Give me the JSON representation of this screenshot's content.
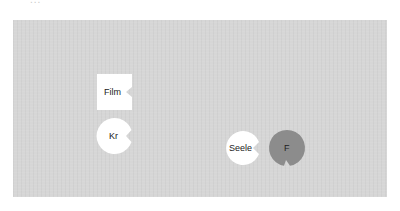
{
  "header": {
    "cut_off_label": "..."
  },
  "colors": {
    "background": "#ffffff",
    "panel": "#d6d6d6",
    "node_white": "#ffffff",
    "node_gray": "#8c8c8c",
    "text": "#222222"
  },
  "nodes": [
    {
      "id": "film",
      "label": "Film",
      "shape": "square-notched"
    },
    {
      "id": "kr",
      "label": "Kr",
      "shape": "circle-notched"
    },
    {
      "id": "seele",
      "label": "Seele",
      "shape": "circle-notched"
    },
    {
      "id": "f",
      "label": "F",
      "shape": "circle-notched-gray"
    }
  ]
}
